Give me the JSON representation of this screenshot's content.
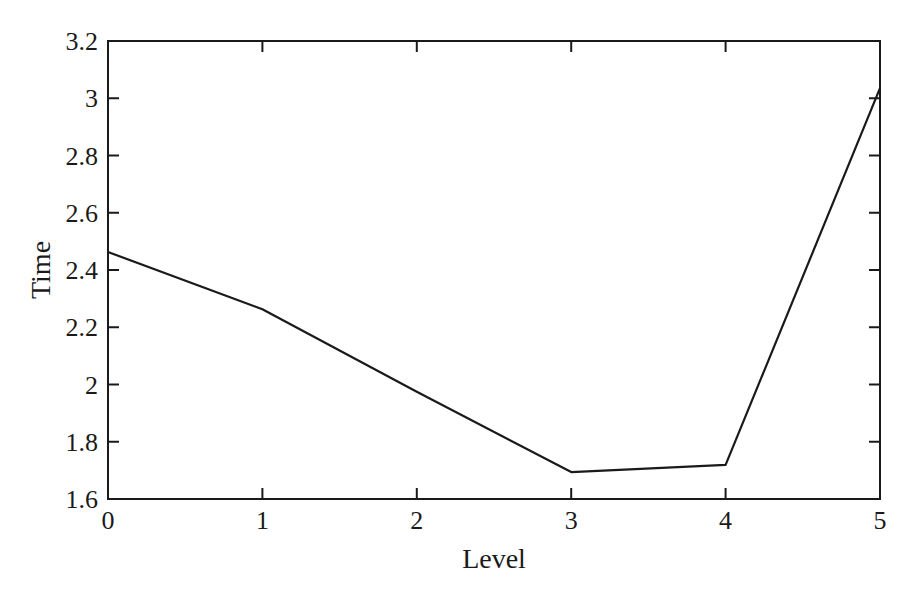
{
  "chart_data": {
    "type": "line",
    "title": "",
    "xlabel": "Level",
    "ylabel": "Time",
    "x": [
      0,
      1,
      2,
      3,
      4,
      5
    ],
    "series": [
      {
        "name": "Time",
        "values": [
          2.463,
          2.263,
          1.975,
          1.694,
          1.719,
          3.035
        ]
      }
    ],
    "xlim": [
      0,
      5
    ],
    "ylim": [
      1.6,
      3.2
    ],
    "xticks": [
      "0",
      "1",
      "2",
      "3",
      "4",
      "5"
    ],
    "yticks": [
      "1.6",
      "1.8",
      "2",
      "2.2",
      "2.4",
      "2.6",
      "2.8",
      "3",
      "3.2"
    ],
    "grid": false,
    "legend": null,
    "line_color": "#1a1a1a"
  }
}
